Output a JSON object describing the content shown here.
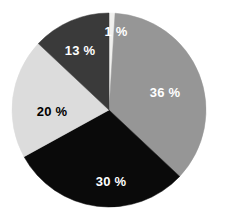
{
  "chart_data": {
    "type": "pie",
    "title": "",
    "subtitle": "",
    "xlabel": "",
    "ylabel": "",
    "grid": false,
    "legend": "none",
    "units": "%",
    "total": 100,
    "start_angle_deg": 0,
    "direction": "clockwise",
    "categories": [
      "1 %",
      "36 %",
      "30 %",
      "20 %",
      "13 %"
    ],
    "values": [
      1,
      36,
      30,
      20,
      13
    ],
    "labels": [
      "1 %",
      "36 %",
      "30 %",
      "20 %",
      "13 %"
    ],
    "colors": [
      "#f0f0ee",
      "#969696",
      "#0a0a0a",
      "#dcdcdc",
      "#3a3a3a"
    ],
    "label_colors": [
      "#ffffff",
      "#ffffff",
      "#ffffff",
      "#000000",
      "#ffffff"
    ],
    "slices": [
      {
        "label": "1 %",
        "value": 1,
        "color": "#f0f0ee",
        "label_color": "#ffffff",
        "label_x": 116,
        "label_y": 31
      },
      {
        "label": "36 %",
        "value": 36,
        "color": "#969696",
        "label_color": "#ffffff",
        "label_x": 165,
        "label_y": 92
      },
      {
        "label": "30 %",
        "value": 30,
        "color": "#0a0a0a",
        "label_color": "#ffffff",
        "label_x": 111,
        "label_y": 181
      },
      {
        "label": "20 %",
        "value": 20,
        "color": "#dcdcdc",
        "label_color": "#000000",
        "label_x": 52,
        "label_y": 111
      },
      {
        "label": "13 %",
        "value": 13,
        "color": "#3a3a3a",
        "label_color": "#ffffff",
        "label_x": 80,
        "label_y": 50
      }
    ],
    "geometry": {
      "center_x": 109,
      "center_y": 110,
      "radius": 97,
      "background": "#ffffff"
    }
  }
}
